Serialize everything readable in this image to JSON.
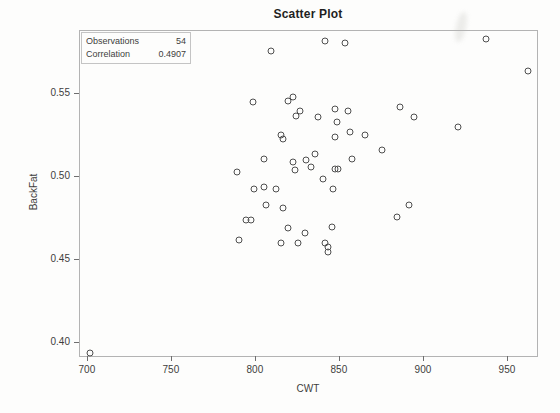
{
  "figure": {
    "title": "Scatter Plot",
    "inset": {
      "rows": [
        {
          "label": "Observations",
          "value": "54"
        },
        {
          "label": "Correlation",
          "value": "0.4907"
        }
      ]
    }
  },
  "chart_data": {
    "type": "scatter",
    "title": "Scatter Plot",
    "xlabel": "CWT",
    "ylabel": "BackFat",
    "xlim": [
      695.3,
      967.3
    ],
    "ylim": [
      0.392,
      0.588
    ],
    "x_ticks": [
      700,
      750,
      800,
      850,
      900,
      950
    ],
    "y_ticks": [
      0.55,
      0.5,
      0.45,
      0.4
    ],
    "y_tick_labels": [
      "0.55",
      "0.50",
      "0.45",
      "0.40"
    ],
    "grid": false,
    "legend": "none",
    "marker_style": "open-circle",
    "observations": 54,
    "correlation": 0.4907,
    "points": [
      [
        841,
        0.582
      ],
      [
        853,
        0.581
      ],
      [
        809,
        0.576
      ],
      [
        937,
        0.583
      ],
      [
        962,
        0.564
      ],
      [
        798,
        0.545
      ],
      [
        819,
        0.546
      ],
      [
        822,
        0.548
      ],
      [
        824,
        0.537
      ],
      [
        826,
        0.54
      ],
      [
        837,
        0.536
      ],
      [
        847,
        0.541
      ],
      [
        855,
        0.54
      ],
      [
        848,
        0.533
      ],
      [
        886,
        0.542
      ],
      [
        894,
        0.536
      ],
      [
        920,
        0.53
      ],
      [
        815,
        0.525
      ],
      [
        816,
        0.523
      ],
      [
        847,
        0.524
      ],
      [
        856,
        0.527
      ],
      [
        865,
        0.525
      ],
      [
        805,
        0.511
      ],
      [
        875,
        0.516
      ],
      [
        835,
        0.514
      ],
      [
        830,
        0.51
      ],
      [
        833,
        0.506
      ],
      [
        822,
        0.509
      ],
      [
        823,
        0.504
      ],
      [
        857,
        0.511
      ],
      [
        847,
        0.505
      ],
      [
        849,
        0.505
      ],
      [
        840,
        0.499
      ],
      [
        789,
        0.503
      ],
      [
        812,
        0.493
      ],
      [
        846,
        0.493
      ],
      [
        799,
        0.493
      ],
      [
        805,
        0.494
      ],
      [
        806,
        0.483
      ],
      [
        816,
        0.481
      ],
      [
        891,
        0.483
      ],
      [
        884,
        0.476
      ],
      [
        819,
        0.469
      ],
      [
        829,
        0.466
      ],
      [
        845,
        0.47
      ],
      [
        794,
        0.474
      ],
      [
        797,
        0.474
      ],
      [
        815,
        0.46
      ],
      [
        825,
        0.46
      ],
      [
        841,
        0.46
      ],
      [
        843,
        0.458
      ],
      [
        843,
        0.455
      ],
      [
        790,
        0.462
      ],
      [
        701,
        0.394
      ]
    ]
  },
  "colors": {
    "background": "#fdfdfc",
    "frame": "#b3b3b3",
    "title": "#1f1f1f",
    "text": "#3d3d3d",
    "marker": "#4f4f4f",
    "tick": "#6e6e6e",
    "inset_border": "#c4c4c4"
  }
}
